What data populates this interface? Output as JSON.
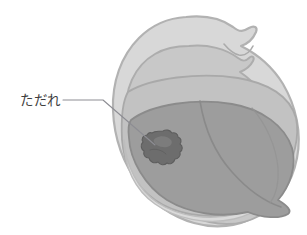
{
  "figure": {
    "title": "",
    "kind": "medical-illustration",
    "background_color": "#ffffff"
  },
  "annotations": [
    {
      "id": "tadare",
      "label": "ただれ",
      "meaning": "erosion / sore",
      "text_color": "#3f3f3f",
      "leader_color": "#8d8d93",
      "text_x": 20,
      "text_y": 105,
      "leader_points": "63,100 103,100 155,145"
    }
  ],
  "anatomy": {
    "outer_lip": {
      "name": "outer-lip",
      "fill": "#d8d8d8",
      "stroke": "#b3b3b3"
    },
    "inner_lip": {
      "name": "inner-lip",
      "fill": "#c9c9c9",
      "stroke": "#aeaeae"
    },
    "oral_cavity": {
      "name": "oral-cavity",
      "fill": "#c2c2c2",
      "stroke": "#a8a8a8"
    },
    "tongue": {
      "name": "tongue",
      "fill": "#9d9d9d",
      "stroke": "#8c8c8c"
    },
    "tongue_groove": {
      "name": "tongue-median-sulcus",
      "stroke": "#8a8a8a"
    },
    "lower_lip_inner": {
      "name": "lower-lip-inner",
      "fill": "#d4d4d4",
      "stroke": "#b6b6b6"
    },
    "lesion": {
      "name": "lesion-erosion",
      "fill": "#6d6d6d",
      "stroke": "#5c5c5c",
      "highlight": "#808080"
    }
  },
  "colors": {
    "white": "#ffffff",
    "light_gray": "#d8d8d8",
    "mid_gray": "#c2c2c2",
    "tongue_gray": "#9d9d9d",
    "lesion_gray": "#6d6d6d",
    "text_gray": "#3f3f3f",
    "leader_gray": "#8d8d93"
  }
}
